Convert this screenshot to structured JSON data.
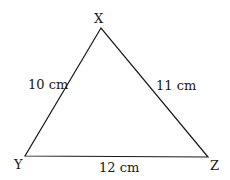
{
  "diagram": {
    "type": "triangle",
    "vertices": {
      "X": {
        "label": "X",
        "x": 101,
        "y": 28
      },
      "Y": {
        "label": "Y",
        "x": 25,
        "y": 156
      },
      "Z": {
        "label": "Z",
        "x": 208,
        "y": 157
      }
    },
    "sides": {
      "XY": {
        "label": "10 cm"
      },
      "XZ": {
        "label": "11 cm"
      },
      "YZ": {
        "label": "12 cm"
      }
    },
    "stroke_color": "#1a1a1a"
  }
}
